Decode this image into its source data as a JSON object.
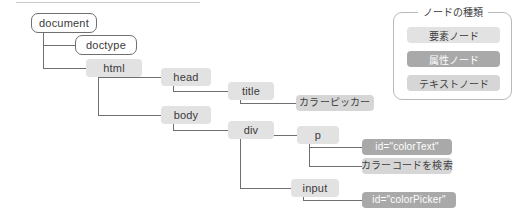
{
  "diagram": {
    "title_rule": "",
    "nodes": [
      {
        "id": "document",
        "label": "document",
        "kind": "document",
        "x": 31,
        "y": 13,
        "w": 66,
        "h": 20,
        "font": 11
      },
      {
        "id": "doctype",
        "label": "doctype",
        "kind": "document",
        "x": 75,
        "y": 35,
        "w": 62,
        "h": 20,
        "font": 11
      },
      {
        "id": "html",
        "label": "html",
        "kind": "element",
        "x": 86,
        "y": 59,
        "w": 56,
        "h": 18,
        "font": 11
      },
      {
        "id": "head",
        "label": "head",
        "kind": "element",
        "x": 161,
        "y": 68,
        "w": 50,
        "h": 18,
        "font": 11
      },
      {
        "id": "title",
        "label": "title",
        "kind": "element",
        "x": 228,
        "y": 82,
        "w": 46,
        "h": 18,
        "font": 11
      },
      {
        "id": "titletext",
        "label": "カラーピッカー",
        "kind": "text",
        "x": 296,
        "y": 95,
        "w": 78,
        "h": 16,
        "font": 10
      },
      {
        "id": "body",
        "label": "body",
        "kind": "element",
        "x": 161,
        "y": 106,
        "w": 50,
        "h": 18,
        "font": 11
      },
      {
        "id": "div",
        "label": "div",
        "kind": "element",
        "x": 228,
        "y": 121,
        "w": 46,
        "h": 18,
        "font": 11
      },
      {
        "id": "p",
        "label": "p",
        "kind": "element",
        "x": 297,
        "y": 126,
        "w": 42,
        "h": 18,
        "font": 11
      },
      {
        "id": "p-attr",
        "label": "id=\"colorText\"",
        "kind": "attribute",
        "x": 362,
        "y": 139,
        "w": 90,
        "h": 16,
        "font": 10
      },
      {
        "id": "p-text",
        "label": "カラーコードを検索",
        "kind": "text",
        "x": 362,
        "y": 158,
        "w": 90,
        "h": 16,
        "font": 10
      },
      {
        "id": "input",
        "label": "input",
        "kind": "element",
        "x": 291,
        "y": 179,
        "w": 48,
        "h": 18,
        "font": 11
      },
      {
        "id": "input-attr",
        "label": "id=\"colorPicker\"",
        "kind": "attribute",
        "x": 362,
        "y": 192,
        "w": 94,
        "h": 16,
        "font": 10
      }
    ],
    "edges": [
      {
        "from": "document",
        "to": "doctype"
      },
      {
        "from": "document",
        "to": "html"
      },
      {
        "from": "html",
        "to": "head"
      },
      {
        "from": "html",
        "to": "body"
      },
      {
        "from": "head",
        "to": "title"
      },
      {
        "from": "title",
        "to": "titletext"
      },
      {
        "from": "body",
        "to": "div"
      },
      {
        "from": "div",
        "to": "p"
      },
      {
        "from": "div",
        "to": "input"
      },
      {
        "from": "p",
        "to": "p-attr"
      },
      {
        "from": "p",
        "to": "p-text"
      },
      {
        "from": "input",
        "to": "input-attr"
      }
    ]
  },
  "legend": {
    "title": "ノードの種類",
    "items": [
      {
        "label": "要素ノード",
        "kind": "element"
      },
      {
        "label": "属性ノード",
        "kind": "attribute"
      },
      {
        "label": "テキストノード",
        "kind": "text"
      }
    ]
  },
  "colors": {
    "element_bg": "#e2e2e2",
    "attribute_bg": "#a9a9a9",
    "text_bg": "#d6d6d6",
    "document_border": "#6f6f72",
    "connector": "#6f6f72",
    "page_bg": "#ffffff",
    "ink": "#3a3a3c"
  }
}
